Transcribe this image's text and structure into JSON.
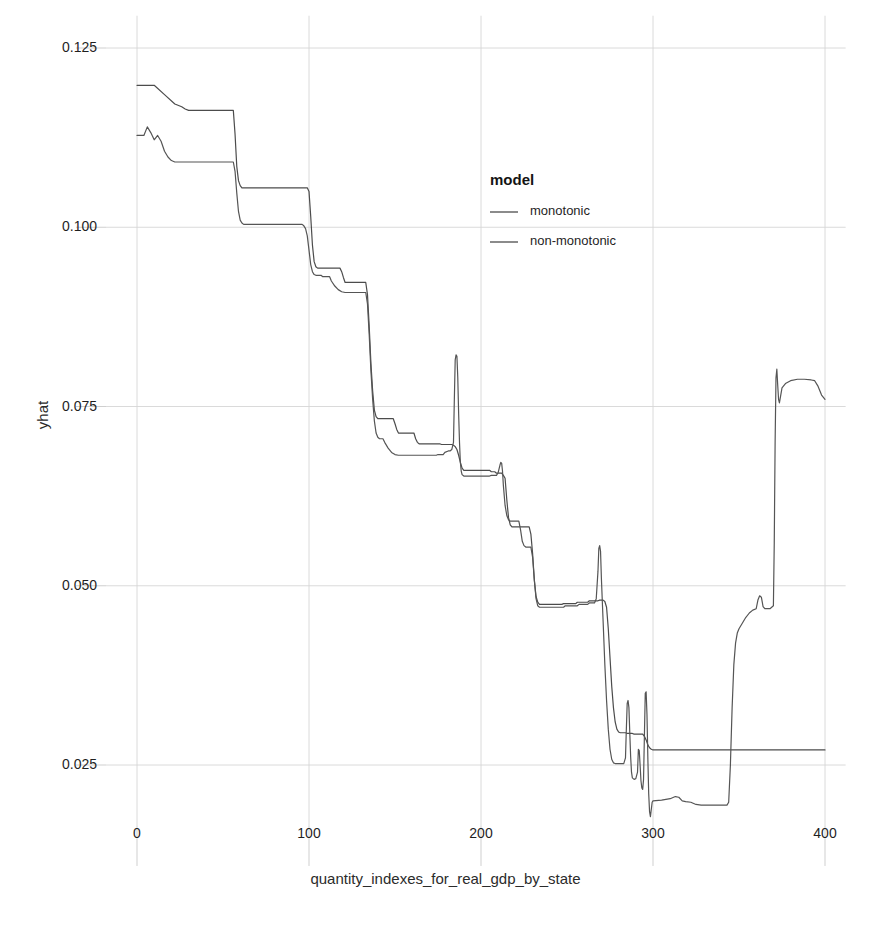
{
  "chart_data": {
    "type": "line",
    "title": "",
    "xlabel": "quantity_indexes_for_real_gdp_by_state",
    "ylabel": "yhat",
    "xlim": [
      -18,
      412
    ],
    "ylim": [
      0.0165,
      0.1295
    ],
    "xticks": [
      0,
      100,
      200,
      300,
      400
    ],
    "xticklabels": [
      "0",
      "100",
      "200",
      "300",
      "400"
    ],
    "yticks": [
      0.025,
      0.05,
      0.075,
      0.1,
      0.125
    ],
    "yticklabels": [
      "0.025",
      "0.050",
      "0.075",
      "0.100",
      "0.125"
    ],
    "grid": true,
    "grid_color": "#d6d6d6",
    "legend": {
      "title": "model",
      "position": "inside-upper-right",
      "entries": [
        {
          "name": "monotonic",
          "color": "#4c4c4c"
        },
        {
          "name": "non-monotonic",
          "color": "#4c4c4c"
        }
      ]
    },
    "series": [
      {
        "name": "monotonic",
        "color": "#4c4c4c",
        "width": 1.2,
        "points": [
          [
            0,
            0.1198
          ],
          [
            10,
            0.1198
          ],
          [
            16,
            0.1185
          ],
          [
            22,
            0.1172
          ],
          [
            26,
            0.1168
          ],
          [
            28,
            0.1165
          ],
          [
            30,
            0.1163
          ],
          [
            56,
            0.1163
          ],
          [
            57,
            0.113
          ],
          [
            58,
            0.1085
          ],
          [
            59,
            0.1065
          ],
          [
            60,
            0.1058
          ],
          [
            61,
            0.1055
          ],
          [
            99,
            0.1055
          ],
          [
            100,
            0.105
          ],
          [
            101,
            0.1015
          ],
          [
            102,
            0.0975
          ],
          [
            103,
            0.0952
          ],
          [
            104,
            0.0945
          ],
          [
            105,
            0.0943
          ],
          [
            118,
            0.0943
          ],
          [
            119,
            0.0938
          ],
          [
            120,
            0.093
          ],
          [
            121,
            0.0923
          ],
          [
            133,
            0.0923
          ],
          [
            134,
            0.0906
          ],
          [
            135,
            0.0862
          ],
          [
            136,
            0.081
          ],
          [
            137,
            0.0772
          ],
          [
            138,
            0.0745
          ],
          [
            139,
            0.0736
          ],
          [
            140,
            0.0733
          ],
          [
            149,
            0.0733
          ],
          [
            150,
            0.0726
          ],
          [
            151,
            0.0718
          ],
          [
            152,
            0.0713
          ],
          [
            161,
            0.0713
          ],
          [
            162,
            0.0705
          ],
          [
            163,
            0.07
          ],
          [
            164,
            0.0698
          ],
          [
            176,
            0.0698
          ],
          [
            177,
            0.0697
          ],
          [
            183,
            0.0697
          ],
          [
            184,
            0.0696
          ],
          [
            185,
            0.0694
          ],
          [
            186,
            0.069
          ],
          [
            187,
            0.0682
          ],
          [
            188,
            0.0672
          ],
          [
            189,
            0.0664
          ],
          [
            190,
            0.0661
          ],
          [
            205,
            0.0661
          ],
          [
            206,
            0.0659
          ],
          [
            208,
            0.0659
          ],
          [
            209,
            0.0657
          ],
          [
            212,
            0.0657
          ],
          [
            213,
            0.0654
          ],
          [
            214,
            0.065
          ],
          [
            215,
            0.062
          ],
          [
            216,
            0.0595
          ],
          [
            217,
            0.0585
          ],
          [
            218,
            0.0582
          ],
          [
            228,
            0.0582
          ],
          [
            229,
            0.0572
          ],
          [
            230,
            0.0545
          ],
          [
            231,
            0.0508
          ],
          [
            232,
            0.0485
          ],
          [
            233,
            0.0477
          ],
          [
            234,
            0.0474
          ],
          [
            247,
            0.0474
          ],
          [
            248,
            0.0475
          ],
          [
            255,
            0.0475
          ],
          [
            256,
            0.0477
          ],
          [
            262,
            0.0477
          ],
          [
            263,
            0.0479
          ],
          [
            268,
            0.0479
          ],
          [
            269,
            0.048
          ],
          [
            271,
            0.048
          ],
          [
            272,
            0.0478
          ],
          [
            273,
            0.047
          ],
          [
            274,
            0.044
          ],
          [
            275,
            0.04
          ],
          [
            276,
            0.036
          ],
          [
            277,
            0.033
          ],
          [
            278,
            0.031
          ],
          [
            279,
            0.03
          ],
          [
            280,
            0.0296
          ],
          [
            281,
            0.0295
          ],
          [
            284,
            0.0295
          ],
          [
            285,
            0.0294
          ],
          [
            288,
            0.0294
          ],
          [
            289,
            0.0293
          ],
          [
            294,
            0.0293
          ],
          [
            295,
            0.029
          ],
          [
            296,
            0.0285
          ],
          [
            297,
            0.0278
          ],
          [
            298,
            0.0274
          ],
          [
            299,
            0.0272
          ],
          [
            300,
            0.0271
          ],
          [
            310,
            0.0271
          ],
          [
            340,
            0.0271
          ],
          [
            360,
            0.0271
          ],
          [
            380,
            0.0271
          ],
          [
            400,
            0.0271
          ]
        ]
      },
      {
        "name": "non-monotonic",
        "color": "#555555",
        "width": 1.2,
        "points": [
          [
            0,
            0.1128
          ],
          [
            4,
            0.1128
          ],
          [
            6,
            0.114
          ],
          [
            8,
            0.1132
          ],
          [
            10,
            0.1122
          ],
          [
            12,
            0.1128
          ],
          [
            14,
            0.112
          ],
          [
            16,
            0.1106
          ],
          [
            18,
            0.1098
          ],
          [
            20,
            0.1093
          ],
          [
            22,
            0.1091
          ],
          [
            56,
            0.1091
          ],
          [
            57,
            0.1078
          ],
          [
            58,
            0.1048
          ],
          [
            59,
            0.1022
          ],
          [
            60,
            0.101
          ],
          [
            61,
            0.1006
          ],
          [
            62,
            0.1004
          ],
          [
            96,
            0.1004
          ],
          [
            97,
            0.1002
          ],
          [
            98,
            0.0998
          ],
          [
            99,
            0.0988
          ],
          [
            100,
            0.0968
          ],
          [
            101,
            0.0948
          ],
          [
            102,
            0.0938
          ],
          [
            103,
            0.0934
          ],
          [
            104,
            0.0933
          ],
          [
            107,
            0.0933
          ],
          [
            108,
            0.0931
          ],
          [
            112,
            0.0931
          ],
          [
            113,
            0.0925
          ],
          [
            115,
            0.0918
          ],
          [
            117,
            0.0913
          ],
          [
            119,
            0.091
          ],
          [
            121,
            0.0909
          ],
          [
            133,
            0.0909
          ],
          [
            134,
            0.0893
          ],
          [
            135,
            0.085
          ],
          [
            136,
            0.08
          ],
          [
            137,
            0.076
          ],
          [
            138,
            0.073
          ],
          [
            139,
            0.0713
          ],
          [
            140,
            0.0707
          ],
          [
            141,
            0.0705
          ],
          [
            143,
            0.0705
          ],
          [
            144,
            0.07
          ],
          [
            146,
            0.0692
          ],
          [
            148,
            0.0686
          ],
          [
            150,
            0.0683
          ],
          [
            152,
            0.0682
          ],
          [
            174,
            0.0682
          ],
          [
            175,
            0.0683
          ],
          [
            178,
            0.0683
          ],
          [
            179,
            0.0686
          ],
          [
            181,
            0.0688
          ],
          [
            182,
            0.0688
          ],
          [
            183,
            0.069
          ],
          [
            184,
            0.07
          ],
          [
            184.5,
            0.076
          ],
          [
            185,
            0.0815
          ],
          [
            185.5,
            0.0822
          ],
          [
            186,
            0.082
          ],
          [
            186.5,
            0.079
          ],
          [
            187,
            0.074
          ],
          [
            187.5,
            0.07
          ],
          [
            188,
            0.0672
          ],
          [
            188.5,
            0.066
          ],
          [
            189,
            0.0655
          ],
          [
            190,
            0.0653
          ],
          [
            205,
            0.0653
          ],
          [
            206,
            0.0654
          ],
          [
            209,
            0.0654
          ],
          [
            210,
            0.0658
          ],
          [
            211,
            0.0668
          ],
          [
            211.5,
            0.0672
          ],
          [
            212,
            0.0671
          ],
          [
            212.5,
            0.066
          ],
          [
            213,
            0.064
          ],
          [
            214,
            0.0612
          ],
          [
            215,
            0.0598
          ],
          [
            216,
            0.0592
          ],
          [
            217,
            0.059
          ],
          [
            222,
            0.059
          ],
          [
            223,
            0.0578
          ],
          [
            224,
            0.0562
          ],
          [
            225,
            0.0556
          ],
          [
            226,
            0.0554
          ],
          [
            229,
            0.0554
          ],
          [
            230,
            0.054
          ],
          [
            231,
            0.0508
          ],
          [
            232,
            0.0482
          ],
          [
            233,
            0.0472
          ],
          [
            234,
            0.047
          ],
          [
            248,
            0.047
          ],
          [
            249,
            0.0472
          ],
          [
            256,
            0.0472
          ],
          [
            257,
            0.0474
          ],
          [
            262,
            0.0474
          ],
          [
            263,
            0.0476
          ],
          [
            266,
            0.0476
          ],
          [
            267,
            0.0482
          ],
          [
            268,
            0.052
          ],
          [
            268.5,
            0.0552
          ],
          [
            269,
            0.0556
          ],
          [
            269.5,
            0.0548
          ],
          [
            270,
            0.051
          ],
          [
            271,
            0.045
          ],
          [
            272,
            0.039
          ],
          [
            273,
            0.034
          ],
          [
            274,
            0.03
          ],
          [
            275,
            0.0272
          ],
          [
            276,
            0.0258
          ],
          [
            277,
            0.0253
          ],
          [
            278,
            0.0252
          ],
          [
            283,
            0.0252
          ],
          [
            284,
            0.026
          ],
          [
            284.5,
            0.03
          ],
          [
            285,
            0.0336
          ],
          [
            285.5,
            0.034
          ],
          [
            286,
            0.033
          ],
          [
            286.5,
            0.0295
          ],
          [
            287,
            0.0262
          ],
          [
            287.5,
            0.024
          ],
          [
            288,
            0.0232
          ],
          [
            289,
            0.023
          ],
          [
            290,
            0.0231
          ],
          [
            291,
            0.024
          ],
          [
            291.5,
            0.0272
          ],
          [
            292,
            0.027
          ],
          [
            292.5,
            0.025
          ],
          [
            293,
            0.0228
          ],
          [
            293.5,
            0.0218
          ],
          [
            294,
            0.0216
          ],
          [
            294.5,
            0.023
          ],
          [
            295,
            0.029
          ],
          [
            295.5,
            0.035
          ],
          [
            296,
            0.0352
          ],
          [
            296.5,
            0.032
          ],
          [
            297,
            0.026
          ],
          [
            297.5,
            0.021
          ],
          [
            298,
            0.0185
          ],
          [
            298.5,
            0.0178
          ],
          [
            299,
            0.0188
          ],
          [
            299.5,
            0.0198
          ],
          [
            300,
            0.02
          ],
          [
            305,
            0.0201
          ],
          [
            310,
            0.0203
          ],
          [
            313,
            0.0206
          ],
          [
            315,
            0.0205
          ],
          [
            317,
            0.02
          ],
          [
            319,
            0.0199
          ],
          [
            322,
            0.0198
          ],
          [
            325,
            0.0195
          ],
          [
            328,
            0.0194
          ],
          [
            331,
            0.0194
          ],
          [
            335,
            0.0194
          ],
          [
            340,
            0.0194
          ],
          [
            343,
            0.0194
          ],
          [
            344,
            0.0198
          ],
          [
            345,
            0.025
          ],
          [
            346,
            0.033
          ],
          [
            347,
            0.039
          ],
          [
            348,
            0.042
          ],
          [
            349,
            0.0434
          ],
          [
            350,
            0.044
          ],
          [
            352,
            0.0448
          ],
          [
            354,
            0.0456
          ],
          [
            356,
            0.0462
          ],
          [
            358,
            0.0466
          ],
          [
            360,
            0.0468
          ],
          [
            361,
            0.048
          ],
          [
            362,
            0.0486
          ],
          [
            363,
            0.0484
          ],
          [
            364,
            0.0471
          ],
          [
            365,
            0.0468
          ],
          [
            368,
            0.0468
          ],
          [
            369,
            0.047
          ],
          [
            370,
            0.0472
          ],
          [
            370.5,
            0.056
          ],
          [
            371,
            0.07
          ],
          [
            371.5,
            0.079
          ],
          [
            372,
            0.0802
          ],
          [
            372.5,
            0.078
          ],
          [
            373,
            0.076
          ],
          [
            373.5,
            0.0755
          ],
          [
            374,
            0.0762
          ],
          [
            375,
            0.0776
          ],
          [
            377,
            0.0782
          ],
          [
            380,
            0.0786
          ],
          [
            384,
            0.0788
          ],
          [
            388,
            0.0788
          ],
          [
            392,
            0.0787
          ],
          [
            394,
            0.0786
          ],
          [
            396,
            0.0778
          ],
          [
            398,
            0.0766
          ],
          [
            400,
            0.076
          ]
        ]
      }
    ]
  },
  "legend_box": {
    "title": "model",
    "items": [
      {
        "label": "monotonic"
      },
      {
        "label": "non-monotonic"
      }
    ]
  },
  "axes": {
    "xlabel": "quantity_indexes_for_real_gdp_by_state",
    "ylabel": "yhat",
    "xticklabels": [
      "0",
      "100",
      "200",
      "300",
      "400"
    ],
    "yticklabels": [
      "0.025",
      "0.050",
      "0.075",
      "0.100",
      "0.125"
    ]
  }
}
